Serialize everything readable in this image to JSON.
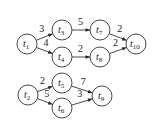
{
  "diagram": {
    "type": "weighted-directed-graph",
    "graphs": [
      {
        "id": "top",
        "nodes": [
          {
            "id": "t1",
            "label": "t",
            "sub": "1",
            "x": 27,
            "y": 44
          },
          {
            "id": "t3",
            "label": "t",
            "sub": "3",
            "x": 62,
            "y": 30
          },
          {
            "id": "t4",
            "label": "t",
            "sub": "4",
            "x": 62,
            "y": 57
          },
          {
            "id": "t7",
            "label": "t",
            "sub": "7",
            "x": 100,
            "y": 30
          },
          {
            "id": "t8",
            "label": "t",
            "sub": "8",
            "x": 100,
            "y": 57
          },
          {
            "id": "t10",
            "label": "t",
            "sub": "10",
            "x": 136,
            "y": 44
          }
        ],
        "edges": [
          {
            "from": "t1",
            "to": "t3",
            "weight": "3"
          },
          {
            "from": "t1",
            "to": "t4",
            "weight": "4"
          },
          {
            "from": "t3",
            "to": "t7",
            "weight": "5"
          },
          {
            "from": "t4",
            "to": "t8",
            "weight": "2"
          },
          {
            "from": "t7",
            "to": "t10",
            "weight": "2"
          },
          {
            "from": "t8",
            "to": "t10",
            "weight": "2"
          }
        ]
      },
      {
        "id": "bottom",
        "nodes": [
          {
            "id": "t2",
            "label": "t",
            "sub": "2",
            "x": 28,
            "y": 95
          },
          {
            "id": "t5",
            "label": "t",
            "sub": "5",
            "x": 62,
            "y": 83
          },
          {
            "id": "t6",
            "label": "t",
            "sub": "6",
            "x": 62,
            "y": 108
          },
          {
            "id": "t9",
            "label": "t",
            "sub": "9",
            "x": 102,
            "y": 96
          }
        ],
        "edges": [
          {
            "from": "t2",
            "to": "t5",
            "weight": "2"
          },
          {
            "from": "t2",
            "to": "t6",
            "weight": "5"
          },
          {
            "from": "t5",
            "to": "t9",
            "weight": "7"
          },
          {
            "from": "t6",
            "to": "t9",
            "weight": "3"
          }
        ]
      }
    ]
  }
}
